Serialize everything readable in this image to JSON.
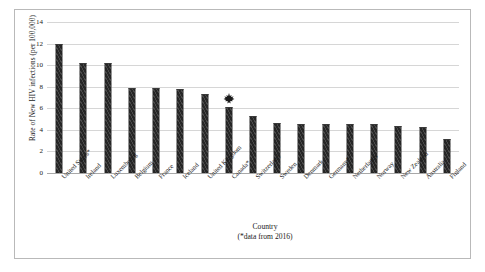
{
  "chart_data": {
    "type": "bar",
    "title": "",
    "xlabel": "Country",
    "xlabel_note": "(*data from 2016)",
    "ylabel": "Rate of New HIV infections (per 100,000)",
    "ylim": [
      0,
      14
    ],
    "yticks": [
      0,
      2,
      4,
      6,
      8,
      10,
      12,
      14
    ],
    "grid": true,
    "legend": "none",
    "bar_color": "#262626",
    "categories": [
      "United States*",
      "Ireland",
      "Luxembourg",
      "Belgium",
      "France",
      "Iceland",
      "United Kingdom",
      "Canada*",
      "Switzerland",
      "Sweden",
      "Denmark",
      "Germany*",
      "Netherlands",
      "Norway",
      "New Zealand",
      "Australia",
      "Finland"
    ],
    "values": [
      12.0,
      10.2,
      10.2,
      7.9,
      7.9,
      7.8,
      7.3,
      6.1,
      5.3,
      4.6,
      4.5,
      4.5,
      4.5,
      4.5,
      4.4,
      4.3,
      3.2
    ],
    "annotations": [
      {
        "icon": "maple-leaf-icon",
        "category": "Canada*",
        "description": "Maple leaf marker highlighting the Canada bar"
      }
    ]
  }
}
